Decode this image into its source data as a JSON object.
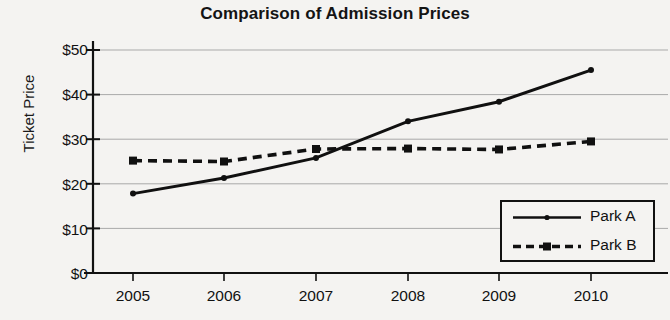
{
  "chart_data": {
    "type": "line",
    "title": "Comparison of Admission Prices",
    "xlabel": "",
    "ylabel": "Ticket Price",
    "categories": [
      "2005",
      "2006",
      "2007",
      "2008",
      "2009",
      "2010"
    ],
    "x": [
      2005,
      2006,
      2007,
      2008,
      2009,
      2010
    ],
    "series": [
      {
        "name": "Park A",
        "style": "solid",
        "color": "#101010",
        "values": [
          17.8,
          21.3,
          25.8,
          34.0,
          38.4,
          45.5
        ]
      },
      {
        "name": "Park B",
        "style": "dashed",
        "color": "#101010",
        "values": [
          25.2,
          25.0,
          27.8,
          27.9,
          27.7,
          29.5
        ]
      }
    ],
    "ylim": [
      0,
      50
    ],
    "yticks": [
      0,
      10,
      20,
      30,
      40,
      50
    ],
    "ytick_labels": [
      "$0",
      "$10",
      "$20",
      "$30",
      "$40",
      "$50"
    ],
    "xtick_labels": [
      "2005",
      "2006",
      "2007",
      "2008",
      "2009",
      "2010"
    ],
    "grid": "horizontal",
    "legend_position": "bottom-right",
    "legend_entries": [
      "Park A",
      "Park B"
    ],
    "background_color": "#f4f3f1",
    "axis_color": "#111111",
    "grid_color": "#a9a9a9"
  }
}
